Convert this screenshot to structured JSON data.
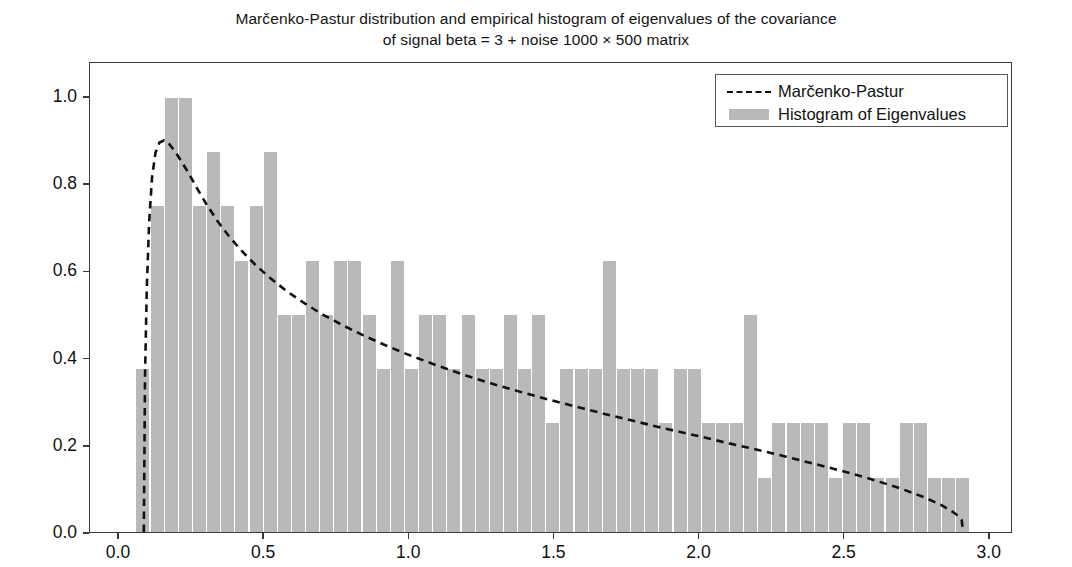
{
  "chart_data": {
    "type": "bar",
    "title": "Marčenko-Pastur distribution and empirical histogram of eigenvalues of the covariance of signal beta = 3 + noise 1000 × 500 matrix",
    "title_line1": "Marčenko-Pastur distribution and empirical histogram of eigenvalues of the covariance",
    "title_line2": "of signal beta = 3 + noise 1000 × 500 matrix",
    "xlabel": "",
    "ylabel": "",
    "xlim": [
      -0.1,
      3.08
    ],
    "ylim": [
      0.0,
      1.08
    ],
    "xticks": [
      0.0,
      0.5,
      1.0,
      1.5,
      2.0,
      2.5,
      3.0
    ],
    "xticklabels": [
      "0.0",
      "0.5",
      "1.0",
      "1.5",
      "2.0",
      "2.5",
      "3.0"
    ],
    "yticks": [
      0.0,
      0.2,
      0.4,
      0.6,
      0.8,
      1.0
    ],
    "yticklabels": [
      "0.0",
      "0.2",
      "0.4",
      "0.6",
      "0.8",
      "1.0"
    ],
    "grid": false,
    "legend_position": "upper right",
    "bar_color": "#b9b9b9",
    "line_color": "#111111",
    "line_style": "dashed",
    "bin_width": 0.0488,
    "bin_edges_start": 0.0605,
    "series": [
      {
        "name": "Histogram of Eigenvalues",
        "type": "bar",
        "bin_left_edges": [
          0.0605,
          0.1093,
          0.1581,
          0.2069,
          0.2557,
          0.3045,
          0.3533,
          0.4021,
          0.4509,
          0.4997,
          0.5485,
          0.5973,
          0.6461,
          0.6949,
          0.7437,
          0.7925,
          0.8413,
          0.8901,
          0.9389,
          0.9877,
          1.0365,
          1.0853,
          1.1341,
          1.1829,
          1.2317,
          1.2805,
          1.3293,
          1.3781,
          1.4269,
          1.4757,
          1.5245,
          1.5733,
          1.6221,
          1.6709,
          1.7197,
          1.7685,
          1.8173,
          1.8661,
          1.9149,
          1.9637,
          2.0125,
          2.0613,
          2.1101,
          2.1589,
          2.2077,
          2.2565,
          2.3053,
          2.3541,
          2.4029,
          2.4517,
          2.5005,
          2.5493,
          2.5981,
          2.6469,
          2.6957,
          2.7445,
          2.7933,
          2.8421,
          2.8909,
          2.9397
        ],
        "values": [
          0.375,
          0.75,
          1.0,
          1.0,
          0.75,
          0.875,
          0.75,
          0.625,
          0.75,
          0.875,
          0.5,
          0.5,
          0.625,
          0.5,
          0.625,
          0.625,
          0.5,
          0.375,
          0.625,
          0.375,
          0.5,
          0.5,
          0.375,
          0.5,
          0.375,
          0.375,
          0.5,
          0.375,
          0.5,
          0.25,
          0.375,
          0.375,
          0.375,
          0.625,
          0.375,
          0.375,
          0.375,
          0.25,
          0.375,
          0.375,
          0.25,
          0.25,
          0.25,
          0.5,
          0.125,
          0.25,
          0.25,
          0.25,
          0.25,
          0.125,
          0.25,
          0.25,
          0.125,
          0.125,
          0.25,
          0.25,
          0.125,
          0.125,
          0.125,
          0.0
        ]
      },
      {
        "name": "Marčenko-Pastur",
        "type": "line",
        "x": [
          0.0858,
          0.09,
          0.096,
          0.104,
          0.114,
          0.126,
          0.14,
          0.156,
          0.174,
          0.194,
          0.216,
          0.24,
          0.27,
          0.3,
          0.34,
          0.38,
          0.42,
          0.47,
          0.52,
          0.58,
          0.64,
          0.7,
          0.77,
          0.84,
          0.92,
          1.0,
          1.1,
          1.2,
          1.3,
          1.4,
          1.5,
          1.6,
          1.7,
          1.8,
          1.9,
          2.0,
          2.1,
          2.2,
          2.3,
          2.4,
          2.5,
          2.6,
          2.7,
          2.78,
          2.84,
          2.88,
          2.9,
          2.91,
          2.9142
        ],
        "y": [
          0.0,
          0.36,
          0.56,
          0.71,
          0.815,
          0.873,
          0.897,
          0.902,
          0.893,
          0.876,
          0.853,
          0.827,
          0.791,
          0.757,
          0.716,
          0.681,
          0.65,
          0.616,
          0.586,
          0.554,
          0.527,
          0.502,
          0.477,
          0.454,
          0.43,
          0.408,
          0.383,
          0.36,
          0.339,
          0.32,
          0.302,
          0.285,
          0.268,
          0.252,
          0.236,
          0.221,
          0.205,
          0.19,
          0.174,
          0.157,
          0.14,
          0.121,
          0.1,
          0.08,
          0.062,
          0.046,
          0.036,
          0.027,
          0.0
        ]
      }
    ]
  },
  "legend": {
    "items": [
      {
        "label": "Marčenko-Pastur",
        "key": "dashed-line-key"
      },
      {
        "label": "Histogram of Eigenvalues",
        "key": "gray-patch-key"
      }
    ]
  }
}
